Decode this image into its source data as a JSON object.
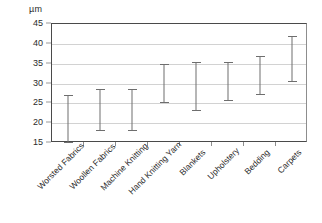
{
  "chart_data": {
    "type": "bar",
    "subtype": "range-bar",
    "title": "",
    "subtitle": "",
    "xlabel": "",
    "ylabel": "",
    "unit_label": "µm",
    "ylim": [
      15,
      45
    ],
    "ytick_values": [
      45,
      40,
      35,
      30,
      25,
      20,
      15
    ],
    "ytick_labels": [
      "45",
      "40",
      "35",
      "30",
      "25",
      "20",
      "15"
    ],
    "grid": true,
    "grid_axis": "y",
    "legend": false,
    "legend_position": "none",
    "categories": [
      "Worsted Fabrics",
      "Woollen Fabrics",
      "Machine Knitting",
      "Hand Knitting Yarn",
      "Blankets",
      "Upholstery",
      "Bedding",
      "Carpets"
    ],
    "series": [
      {
        "name": "Fibre diameter range",
        "low": [
          15.0,
          18.0,
          18.0,
          25.0,
          23.0,
          25.5,
          27.0,
          30.5
        ],
        "high": [
          27.0,
          28.5,
          28.5,
          35.0,
          35.5,
          35.5,
          37.0,
          42.0
        ]
      }
    ],
    "colors": {
      "bar": "#6e6e6e",
      "axis": "#4a4a4a",
      "grid": "#d2d2d2",
      "text": "#2b2b2b",
      "background": "#ffffff"
    }
  }
}
